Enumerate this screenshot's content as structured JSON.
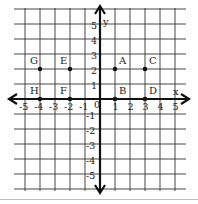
{
  "diagram": {
    "type": "coordinate-plane",
    "x_axis_label": "x",
    "y_axis_label": "y",
    "x_range": [
      -5,
      5
    ],
    "y_range": [
      -5,
      5
    ],
    "x_ticks": [
      "-5",
      "-4",
      "-3",
      "-2",
      "-1",
      "1",
      "2",
      "3",
      "4",
      "5"
    ],
    "y_ticks_positive": [
      "1",
      "2",
      "3",
      "4",
      "5"
    ],
    "y_ticks_negative": [
      "-1",
      "-2",
      "-3",
      "-4",
      "-5"
    ],
    "origin_label": "0",
    "points": [
      {
        "label": "A",
        "x": 1,
        "y": 2
      },
      {
        "label": "B",
        "x": 1,
        "y": 0
      },
      {
        "label": "C",
        "x": 3,
        "y": 2
      },
      {
        "label": "D",
        "x": 3,
        "y": 0
      },
      {
        "label": "E",
        "x": -2,
        "y": 2
      },
      {
        "label": "F",
        "x": -2,
        "y": 0
      },
      {
        "label": "G",
        "x": -4,
        "y": 2
      },
      {
        "label": "H",
        "x": -4,
        "y": 0
      }
    ],
    "colors": {
      "grid": "#333333",
      "axis": "#111111",
      "point": "#111111",
      "text": "#222222"
    }
  }
}
